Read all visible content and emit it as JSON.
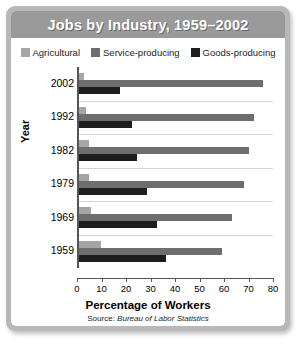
{
  "card": {
    "title": "Jobs by Industry, 1959–2002",
    "frame_color": "#b8b8b8",
    "title_bar_color": "#9a9a9a"
  },
  "legend": {
    "items": [
      {
        "label": "Agricultural",
        "color": "#a5a5a5"
      },
      {
        "label": "Service-producing",
        "color": "#6e6e6e"
      },
      {
        "label": "Goods-producing",
        "color": "#1e1e1e"
      }
    ]
  },
  "source": {
    "prefix": "Source:",
    "text": "Bureau of Labor Statistics"
  },
  "chart_data": {
    "type": "bar",
    "orientation": "horizontal",
    "title": "Jobs by Industry, 1959–2002",
    "xlabel": "Percentage of Workers",
    "ylabel": "Year",
    "xlim": [
      0,
      80
    ],
    "xticks": [
      0,
      10,
      20,
      30,
      40,
      50,
      60,
      70,
      80
    ],
    "grid": true,
    "legend_position": "top",
    "categories": [
      "2002",
      "1992",
      "1982",
      "1979",
      "1969",
      "1959"
    ],
    "series": [
      {
        "name": "Agricultural",
        "color": "#a5a5a5",
        "values": [
          2,
          3,
          4,
          4,
          5,
          9
        ]
      },
      {
        "name": "Service-producing",
        "color": "#6e6e6e",
        "values": [
          76,
          72,
          70,
          68,
          63,
          59
        ]
      },
      {
        "name": "Goods-producing",
        "color": "#1e1e1e",
        "values": [
          17,
          22,
          24,
          28,
          32,
          36
        ]
      }
    ]
  }
}
